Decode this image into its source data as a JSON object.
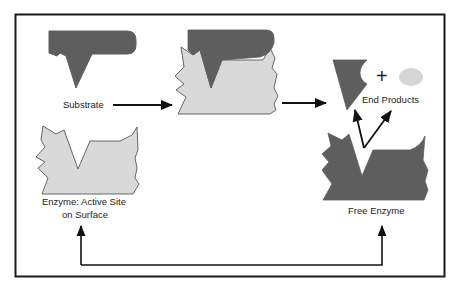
{
  "diagram": {
    "colors": {
      "frame": "#1a1a1a",
      "substrate_dark": "#5e5e5e",
      "enzyme_light": "#d9d9d9",
      "product_light": "#d6d6d6",
      "outline": "#444444",
      "arrow": "#111111",
      "background": "#ffffff"
    },
    "labels": {
      "substrate": "Substrate",
      "enzyme_line1": "Enzyme:  Active Site",
      "enzyme_line2": "on Surface",
      "end_products": "End Products",
      "free_enzyme": "Free Enzyme",
      "plus_sign": "+"
    },
    "nodes": [
      {
        "id": "substrate",
        "label": "Substrate",
        "shade": "dark"
      },
      {
        "id": "enzyme",
        "label": "Enzyme: Active Site on Surface",
        "shade": "light"
      },
      {
        "id": "enzyme-substrate-complex",
        "label": "",
        "shade": "mixed"
      },
      {
        "id": "end-products",
        "label": "End Products",
        "shade": "mixed"
      },
      {
        "id": "free-enzyme",
        "label": "Free Enzyme",
        "shade": "dark"
      }
    ],
    "edges": [
      {
        "from": "substrate",
        "to": "enzyme-substrate-complex"
      },
      {
        "from": "enzyme-substrate-complex",
        "to": "end-products"
      },
      {
        "from": "free-enzyme",
        "to": "end-products",
        "count": 2
      },
      {
        "from": "enzyme",
        "to": "free-enzyme",
        "bidirectional": true
      }
    ]
  }
}
